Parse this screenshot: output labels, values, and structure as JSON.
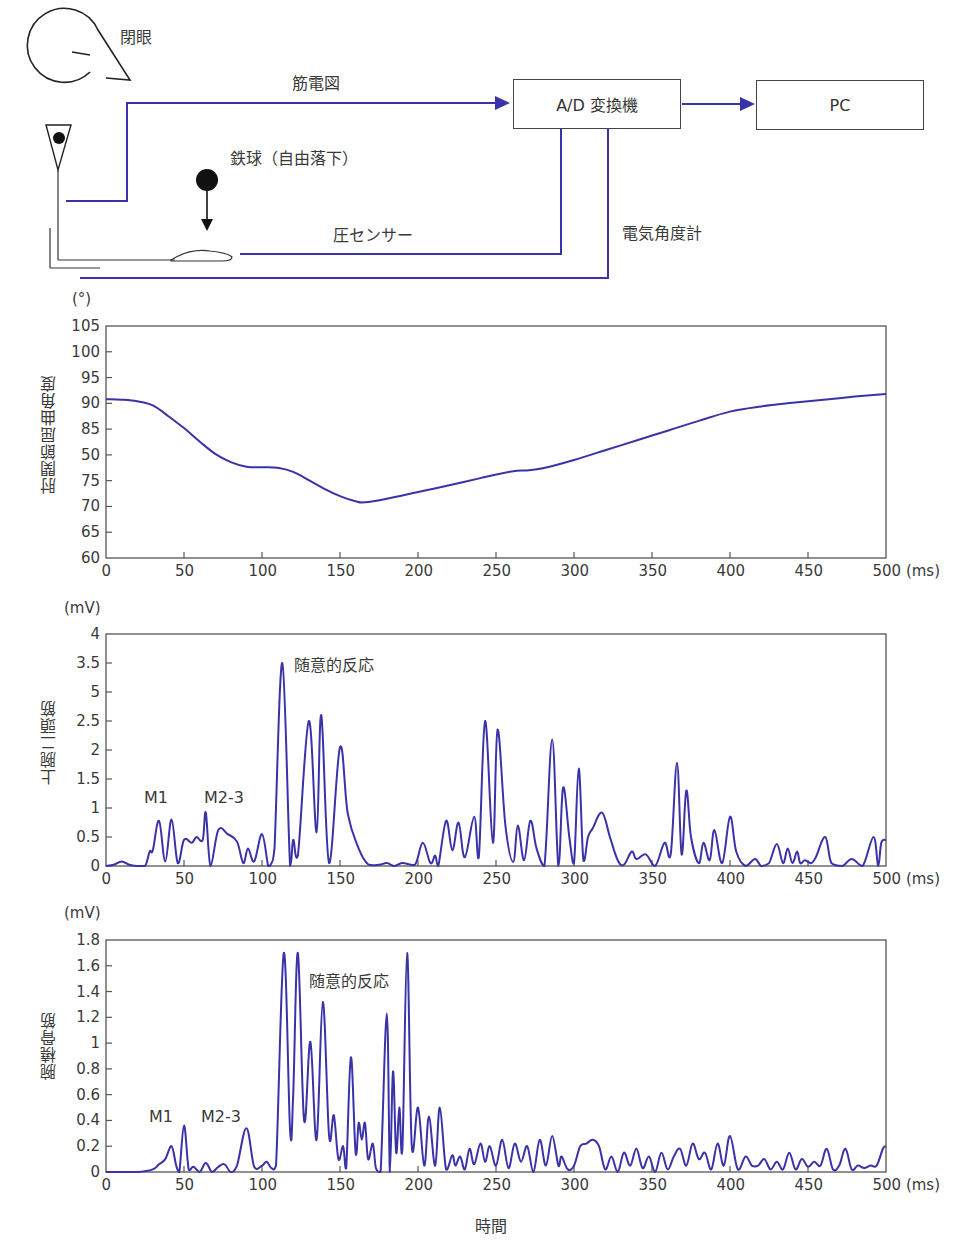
{
  "diagram": {
    "eye_label": "閉眼",
    "emg_label": "筋電図",
    "ball_label": "鉄球（自由落下）",
    "pressure_label": "圧センサー",
    "goniometer_label": "電気角度計",
    "ad_box": "A/D 変換機",
    "pc_box": "PC",
    "line_color": "#3a32a8"
  },
  "x_axis": {
    "ticks": [
      "0",
      "50",
      "100",
      "150",
      "200",
      "250",
      "300",
      "350",
      "400",
      "450",
      "500"
    ],
    "unit": "(ms)",
    "title": "時間"
  },
  "chart_data": [
    {
      "type": "line",
      "title": "",
      "ylabel": "肘関節屈曲角度",
      "yunit": "(°)",
      "xlabel": "時間",
      "xunit": "(ms)",
      "xlim": [
        0,
        500
      ],
      "ylim": [
        60,
        105
      ],
      "yticks": [
        "105",
        "100",
        "95",
        "90",
        "85",
        "50",
        "75",
        "70",
        "65",
        "60"
      ],
      "grid": false,
      "series": [
        {
          "name": "肘関節屈曲角度",
          "color": "#3a32a8",
          "x": [
            0,
            10,
            20,
            30,
            40,
            50,
            60,
            70,
            80,
            90,
            100,
            110,
            120,
            130,
            140,
            150,
            160,
            166,
            180,
            200,
            220,
            240,
            260,
            270,
            280,
            300,
            320,
            340,
            360,
            380,
            400,
            420,
            440,
            460,
            480,
            500
          ],
          "y": [
            90.8,
            90.7,
            90.4,
            89.6,
            87.5,
            85.2,
            82.6,
            80.2,
            78.6,
            77.7,
            77.6,
            77.5,
            76.7,
            75.1,
            73.4,
            72.0,
            71.0,
            70.8,
            71.5,
            72.8,
            74.1,
            75.5,
            76.8,
            77.0,
            77.4,
            79.0,
            80.9,
            82.8,
            84.7,
            86.6,
            88.4,
            89.4,
            90.1,
            90.7,
            91.3,
            91.8
          ]
        }
      ],
      "annotations": []
    },
    {
      "type": "line",
      "title": "",
      "ylabel": "上腕二頭筋",
      "yunit": "(mV)",
      "xlabel": "時間",
      "xunit": "(ms)",
      "xlim": [
        0,
        500
      ],
      "ylim": [
        0,
        4
      ],
      "yticks": [
        "4",
        "3.5",
        "5",
        "2.5",
        "2",
        "1.5",
        "1",
        "0.5",
        "0"
      ],
      "grid": false,
      "series": [
        {
          "name": "上腕二頭筋 EMG",
          "color": "#3a32a8",
          "x": [
            0,
            5,
            10,
            15,
            20,
            25,
            28,
            30,
            34,
            38,
            42,
            46,
            50,
            55,
            58,
            62,
            64,
            67,
            72,
            78,
            84,
            88,
            91,
            95,
            100,
            104,
            106,
            108,
            113,
            118,
            120,
            123,
            130,
            135,
            138,
            143,
            150,
            155,
            162,
            168,
            175,
            180,
            185,
            190,
            198,
            203,
            208,
            211,
            213,
            218,
            222,
            226,
            230,
            236,
            239,
            243,
            248,
            251,
            256,
            261,
            264,
            268,
            272,
            276,
            281,
            286,
            290,
            293,
            297,
            300,
            303,
            306,
            309,
            312,
            318,
            323,
            328,
            332,
            337,
            340,
            346,
            352,
            358,
            362,
            366,
            369,
            372,
            375,
            380,
            383,
            387,
            390,
            395,
            400,
            404,
            410,
            416,
            420,
            425,
            430,
            434,
            437,
            440,
            443,
            445,
            448,
            452,
            455,
            461,
            465,
            472,
            478,
            485,
            492,
            495,
            497,
            500
          ],
          "y": [
            0,
            0.02,
            0.08,
            0.02,
            0,
            0,
            0.25,
            0.27,
            0.78,
            0.08,
            0.8,
            0.05,
            0.45,
            0.4,
            0.5,
            0.45,
            0.92,
            0,
            0.62,
            0.55,
            0.42,
            0.05,
            0.3,
            0.08,
            0.55,
            0,
            0.05,
            0.3,
            3.5,
            0,
            0.45,
            0.18,
            2.5,
            0.58,
            2.6,
            0.05,
            2.05,
            0.9,
            0.3,
            0.03,
            0.02,
            0.05,
            0,
            0.05,
            0.02,
            0.4,
            0.05,
            0.18,
            0,
            0.78,
            0.27,
            0.75,
            0.15,
            0.85,
            0.15,
            2.5,
            0.4,
            2.35,
            0.7,
            0.07,
            0.7,
            0.1,
            0.78,
            0.3,
            0,
            2.18,
            0,
            1.35,
            0.5,
            0.05,
            1.68,
            0.1,
            0.5,
            0.65,
            0.92,
            0.5,
            0.1,
            0.02,
            0.25,
            0.12,
            0.2,
            0,
            0.4,
            0.2,
            1.78,
            0.2,
            1.3,
            0.5,
            0.05,
            0.4,
            0.1,
            0.62,
            0.05,
            0.85,
            0.25,
            0,
            0.12,
            0,
            0.05,
            0.38,
            0.05,
            0.3,
            0.05,
            0.25,
            0.05,
            0.1,
            0.05,
            0.15,
            0.5,
            0.05,
            0,
            0.12,
            0,
            0.5,
            0,
            0.4,
            0.45
          ]
        }
      ],
      "annotations": [
        {
          "text": "M1",
          "x": 35,
          "y": 1.0
        },
        {
          "text": "M2-3",
          "x": 70,
          "y": 1.0
        },
        {
          "text": "随意的反応",
          "x": 140,
          "y": 3.5
        }
      ]
    },
    {
      "type": "line",
      "title": "",
      "ylabel": "腕橈骨筋",
      "yunit": "(mV)",
      "xlabel": "時間",
      "xunit": "(ms)",
      "xlim": [
        0,
        500
      ],
      "ylim": [
        0,
        1.8
      ],
      "yticks": [
        "1.8",
        "1.6",
        "1.4",
        "1.2",
        "1",
        "0.8",
        "0.6",
        "0.4",
        "0.2",
        "0"
      ],
      "grid": false,
      "series": [
        {
          "name": "腕橈骨筋 EMG",
          "color": "#3a32a8",
          "x": [
            0,
            20,
            30,
            34,
            38,
            42,
            45,
            47,
            50,
            53,
            56,
            60,
            64,
            68,
            72,
            76,
            80,
            84,
            90,
            95,
            100,
            103,
            106,
            109,
            114,
            118,
            120,
            123,
            127,
            131,
            135,
            139,
            143,
            146,
            149,
            152,
            154,
            157,
            160,
            162,
            164,
            166,
            168,
            171,
            173,
            176,
            180,
            182,
            184,
            186,
            188,
            190,
            193,
            196,
            200,
            204,
            207,
            211,
            214,
            218,
            222,
            224,
            227,
            230,
            233,
            236,
            240,
            243,
            246,
            250,
            254,
            258,
            262,
            266,
            270,
            274,
            278,
            282,
            286,
            290,
            292,
            296,
            300,
            304,
            308,
            312,
            316,
            320,
            324,
            328,
            332,
            336,
            340,
            344,
            348,
            352,
            356,
            360,
            364,
            368,
            372,
            376,
            380,
            384,
            388,
            392,
            396,
            400,
            405,
            410,
            414,
            418,
            422,
            426,
            430,
            434,
            438,
            442,
            446,
            450,
            454,
            458,
            462,
            466,
            470,
            474,
            478,
            482,
            486,
            490,
            494,
            498,
            500
          ],
          "y": [
            0,
            0,
            0.02,
            0.06,
            0.1,
            0.2,
            0.05,
            0,
            0.36,
            0.02,
            0.04,
            0,
            0.07,
            0,
            0.04,
            0.06,
            0,
            0.05,
            0.34,
            0.04,
            0.05,
            0.08,
            0.03,
            0.05,
            1.7,
            0.32,
            0.6,
            1.7,
            0.4,
            1.01,
            0.25,
            1.32,
            0.28,
            0.44,
            0.1,
            0.2,
            0.03,
            0.89,
            0.15,
            0.38,
            0.25,
            0.38,
            0.1,
            0.22,
            0.03,
            0,
            1.23,
            0,
            0.78,
            0.15,
            0.5,
            0.18,
            1.7,
            0.2,
            0.5,
            0.05,
            0.43,
            0.05,
            0.5,
            0.02,
            0.13,
            0.05,
            0.12,
            0.02,
            0.18,
            0.06,
            0.22,
            0.08,
            0.2,
            0.05,
            0.25,
            0.03,
            0.22,
            0.08,
            0.2,
            0,
            0.25,
            0.05,
            0.28,
            0.05,
            0.12,
            0.02,
            0.05,
            0.2,
            0.22,
            0.25,
            0.2,
            0.02,
            0.12,
            0,
            0.15,
            0.05,
            0.18,
            0.03,
            0.12,
            0,
            0.15,
            0.02,
            0.12,
            0.18,
            0.05,
            0.22,
            0.1,
            0.15,
            0.02,
            0.22,
            0.05,
            0.28,
            0.02,
            0.12,
            0.05,
            0.05,
            0.1,
            0.02,
            0.08,
            0.02,
            0.15,
            0.02,
            0.1,
            0.04,
            0.08,
            0.05,
            0.18,
            0.02,
            0.05,
            0.18,
            0.02,
            0.05,
            0.03,
            0.05,
            0.05,
            0.18,
            0.2
          ]
        }
      ],
      "annotations": [
        {
          "text": "M1",
          "x": 38,
          "y": 0.38
        },
        {
          "text": "M2-3",
          "x": 70,
          "y": 0.38
        },
        {
          "text": "随意的反応",
          "x": 150,
          "y": 1.4
        }
      ]
    }
  ]
}
